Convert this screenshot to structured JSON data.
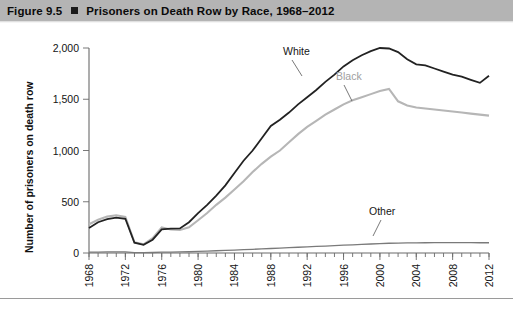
{
  "header": {
    "figure_number": "Figure 9.5",
    "bullet_icon": "filled-square-icon",
    "title": "Prisoners on Death Row by Race, 1968–2012",
    "bar_color": "#b4b4b4"
  },
  "axes": {
    "ylabel": "Number of prisoners on death row",
    "yticks": [
      "0",
      "500",
      "1,000",
      "1,500",
      "2,000"
    ],
    "xticks": [
      "1968",
      "1972",
      "1976",
      "1980",
      "1984",
      "1988",
      "1992",
      "1996",
      "2000",
      "2004",
      "2008",
      "2012"
    ]
  },
  "series_labels": {
    "white": "White",
    "black": "Black",
    "other": "Other"
  },
  "chart_data": {
    "type": "line",
    "title": "Prisoners on Death Row by Race, 1968–2012",
    "xlabel": "",
    "ylabel": "Number of prisoners on death row",
    "xlim": [
      1968,
      2012
    ],
    "ylim": [
      0,
      2000
    ],
    "grid": false,
    "legend": "inline-annotations",
    "x": [
      1968,
      1969,
      1970,
      1971,
      1972,
      1973,
      1974,
      1975,
      1976,
      1977,
      1978,
      1979,
      1980,
      1981,
      1982,
      1983,
      1984,
      1985,
      1986,
      1987,
      1988,
      1989,
      1990,
      1991,
      1992,
      1993,
      1994,
      1995,
      1996,
      1997,
      1998,
      1999,
      2000,
      2001,
      2002,
      2003,
      2004,
      2005,
      2006,
      2007,
      2008,
      2009,
      2010,
      2011,
      2012
    ],
    "series": [
      {
        "name": "White",
        "color": "#222222",
        "values": [
          243,
          300,
          330,
          345,
          334,
          100,
          80,
          130,
          230,
          238,
          240,
          300,
          390,
          470,
          560,
          660,
          780,
          900,
          1000,
          1120,
          1240,
          1300,
          1370,
          1450,
          1520,
          1590,
          1670,
          1740,
          1820,
          1880,
          1930,
          1970,
          2000,
          1995,
          1960,
          1890,
          1840,
          1830,
          1800,
          1770,
          1740,
          1720,
          1690,
          1660,
          1730
        ]
      },
      {
        "name": "Black",
        "color": "#b6b6b6",
        "values": [
          280,
          325,
          355,
          368,
          352,
          105,
          85,
          145,
          250,
          230,
          225,
          250,
          320,
          390,
          470,
          540,
          620,
          700,
          790,
          870,
          940,
          1000,
          1080,
          1160,
          1230,
          1290,
          1350,
          1400,
          1450,
          1490,
          1520,
          1550,
          1580,
          1600,
          1480,
          1440,
          1420,
          1410,
          1400,
          1390,
          1380,
          1370,
          1360,
          1350,
          1340
        ]
      },
      {
        "name": "Other",
        "color": "#7a7a7a",
        "values": [
          8,
          9,
          10,
          11,
          10,
          4,
          3,
          5,
          8,
          9,
          10,
          12,
          15,
          18,
          22,
          25,
          28,
          32,
          36,
          40,
          44,
          48,
          52,
          56,
          60,
          64,
          68,
          72,
          76,
          80,
          84,
          88,
          92,
          95,
          97,
          98,
          99,
          100,
          101,
          102,
          102,
          102,
          101,
          100,
          100
        ]
      }
    ]
  }
}
